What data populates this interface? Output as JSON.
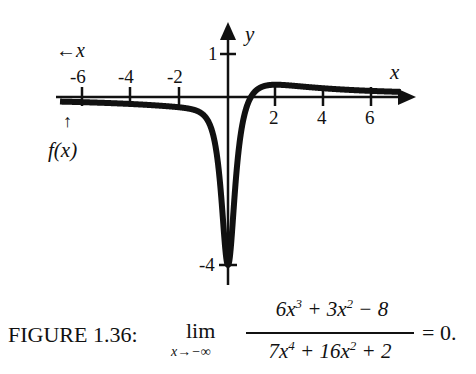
{
  "chart_data": {
    "type": "line",
    "title": "",
    "function": "(6x^3 + 3x^2 - 8) / (7x^4 + 16x^2 + 2)",
    "xlabel": "x",
    "ylabel": "y",
    "xlim": [
      -7.0,
      7.2
    ],
    "ylim": [
      -4.4,
      1.75
    ],
    "x_ticks": [
      -6,
      -4,
      -2,
      2,
      4,
      6
    ],
    "x_tick_labels": [
      "-6",
      "-4",
      "-2",
      "2",
      "4",
      "6"
    ],
    "y_ticks": [
      1,
      -4
    ],
    "y_tick_labels": [
      "1",
      "-4"
    ],
    "grid": false,
    "legend": null,
    "annotations": [
      {
        "text": "←x",
        "meaning": "x approaches -infinity"
      },
      {
        "text": "↑ f(x)",
        "meaning": "f(x) approaches 0 from below"
      }
    ],
    "key_points": [
      {
        "x": 0,
        "y": -4
      },
      {
        "x": 1.1,
        "y": 0.0
      },
      {
        "x": 2,
        "y": 0.33
      },
      {
        "x": -6,
        "y": -0.12
      },
      {
        "x": 6,
        "y": 0.14
      }
    ]
  },
  "labels": {
    "x_axis": "x",
    "y_axis": "y",
    "left_arrow_x": "←x",
    "fx_arrow": "↑",
    "fx": "f(x)",
    "ticks": {
      "xm6": "-6",
      "xm4": "-4",
      "xm2": "-2",
      "x2": "2",
      "x4": "4",
      "x6": "6",
      "y1": "1",
      "ym4": "-4"
    }
  },
  "caption": {
    "label": "FIGURE 1.36:",
    "lim": "lim",
    "lim_sub": "x→−∞",
    "numerator_html": "6x<sup>3</sup> + 3x<sup>2</sup> − 8",
    "denominator_html": "7x<sup>4</sup> + 16x<sup>2</sup> + 2",
    "equals": "= 0."
  },
  "colors": {
    "ink": "#111111",
    "background": "#ffffff"
  }
}
